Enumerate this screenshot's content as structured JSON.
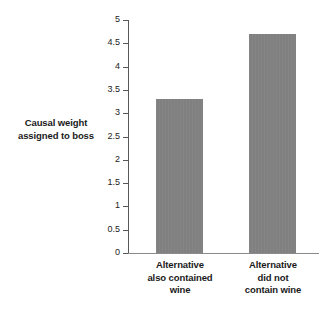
{
  "chart_data": {
    "type": "bar",
    "title": "",
    "xlabel": "",
    "ylabel": "Causal weight assigned to boss",
    "ylim": [
      0,
      5
    ],
    "grid": false,
    "legend": "none",
    "orientation": "vertical",
    "bar_color": "#808080",
    "axis_color": "#58585a",
    "background": "#ffffff",
    "categories": [
      "Alternative also contained wine",
      "Alternative did not contain wine"
    ],
    "category_lines": [
      [
        "Alternative",
        "also contained",
        "wine"
      ],
      [
        "Alternative",
        "did not",
        "contain wine"
      ]
    ],
    "values": [
      3.3,
      4.7
    ],
    "yticks": [
      0,
      0.5,
      1,
      1.5,
      2,
      2.5,
      3,
      3.5,
      4,
      4.5,
      5
    ],
    "ytick_labels": [
      "0",
      "0.5",
      "1",
      "1.5",
      "2",
      "2.5",
      "3",
      "3.5",
      "4",
      "4.5",
      "5"
    ]
  },
  "axis": {
    "y_label_line_1": "Causal weight",
    "y_label_line_2": "assigned to boss"
  }
}
